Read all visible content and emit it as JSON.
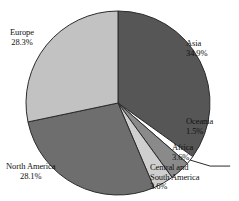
{
  "chart_data": {
    "type": "pie",
    "title": "",
    "subtitle": "",
    "xlabel": "",
    "ylabel": "",
    "legend_position": "none",
    "grid": false,
    "start_angle_deg": 0,
    "direction": "clockwise",
    "categories": [
      "Asia",
      "Oceania",
      "Africa",
      "Central and South America",
      "North America",
      "Europe"
    ],
    "values": [
      34.9,
      1.5,
      3.6,
      3.6,
      28.1,
      28.3
    ],
    "value_unit": "%",
    "slices": [
      {
        "label": "Asia",
        "label_line1": "Asia",
        "label_line2": "34.9%",
        "value": 34.9,
        "value_text": "34.9%",
        "color": "#565656",
        "leader_line": false
      },
      {
        "label": "Oceania",
        "label_line1": "Oceania",
        "label_line2": "1.5%",
        "value": 1.5,
        "value_text": "1.5%",
        "color": "#ffffff",
        "leader_line": true
      },
      {
        "label": "Africa",
        "label_line1": "Africa",
        "label_line2": "3.6%",
        "value": 3.6,
        "value_text": "3.6%",
        "color": "#8a8a8a",
        "leader_line": false
      },
      {
        "label": "Central and South America",
        "label_line1": "Central and",
        "label_line2": "South America",
        "label_line3": "3.6%",
        "value": 3.6,
        "value_text": "3.6%",
        "color": "#cfcfcf",
        "leader_line": false
      },
      {
        "label": "North America",
        "label_line1": "North America",
        "label_line2": "28.1%",
        "value": 28.1,
        "value_text": "28.1%",
        "color": "#6e6e6e",
        "leader_line": false
      },
      {
        "label": "Europe",
        "label_line1": "Europe",
        "label_line2": "28.3%",
        "value": 28.3,
        "value_text": "28.3%",
        "color": "#c2c2c2",
        "leader_line": false
      }
    ]
  },
  "figure": {
    "background_color": "#ffffff",
    "outline_color": "#2b2b2b",
    "text_color": "#111111"
  }
}
